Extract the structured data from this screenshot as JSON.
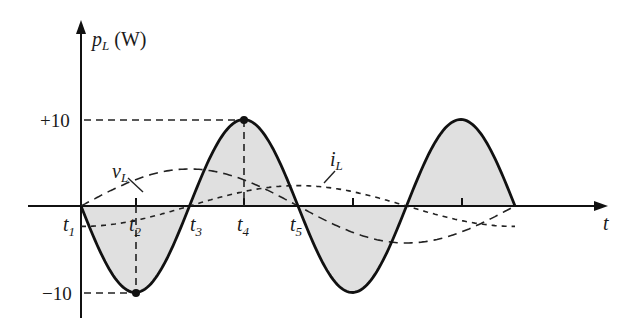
{
  "chart_data": {
    "type": "line",
    "title": "",
    "ylabel": "p_L (W)",
    "xlabel": "t",
    "y_ticks": [
      "+10",
      "-10"
    ],
    "ylim": [
      -10,
      10
    ],
    "time_labels": [
      "t1",
      "t2",
      "t3",
      "t4",
      "t5"
    ],
    "series": [
      {
        "name": "p_L",
        "style": "solid, shaded",
        "description": "sinusoid at twice frequency, starts at 0 going negative, min -10 at t2, zero at t3, max +10 at t4, zero at t5, continues to min -10, zero, max +10, zero"
      },
      {
        "name": "v_L",
        "style": "long-dashed",
        "description": "sinusoid starting at 0 at t1, peaking near t3, crossing zero at t5"
      },
      {
        "name": "i_L",
        "style": "short-dashed",
        "description": "sinusoid lagging v_L by 90°, minimum at t1, zero at t3, max near t5"
      }
    ]
  },
  "labels": {
    "y_axis_symbol": "p",
    "y_axis_sub": "L",
    "y_axis_unit": " (W)",
    "x_axis": "t",
    "plus10": "+10",
    "minus10": "−10",
    "vL": "v",
    "vL_sub": "L",
    "iL": "i",
    "iL_sub": "L",
    "t1": "t",
    "t1_sub": "1",
    "t2": "t",
    "t2_sub": "2",
    "t3": "t",
    "t3_sub": "3",
    "t4": "t",
    "t4_sub": "4",
    "t5": "t",
    "t5_sub": "5"
  }
}
